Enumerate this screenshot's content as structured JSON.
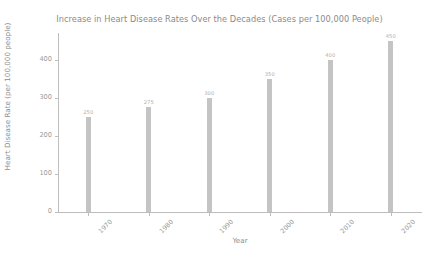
{
  "chart_data": {
    "type": "bar",
    "title": "Increase in Heart Disease Rates Over the Decades (Cases per 100,000 People)",
    "xlabel": "Year",
    "ylabel": "Heart Disease Rate (per 100,000 people)",
    "categories": [
      "1970",
      "1980",
      "1990",
      "2000",
      "2010",
      "2020"
    ],
    "values": [
      250,
      275,
      300,
      350,
      400,
      450
    ],
    "value_labels": [
      "250",
      "275",
      "300",
      "350",
      "400",
      "450"
    ],
    "yticks": [
      0,
      100,
      200,
      300,
      400
    ],
    "ytick_labels": [
      "0",
      "100",
      "200",
      "300",
      "400"
    ],
    "ylim": [
      0,
      470
    ],
    "grid": false,
    "legend": null,
    "bar_color": "#c4c4c4",
    "text_color": "#8f8f8f",
    "axis_color": "#bdbdbd",
    "background": "#ffffff",
    "xtick_rotation": -45
  }
}
